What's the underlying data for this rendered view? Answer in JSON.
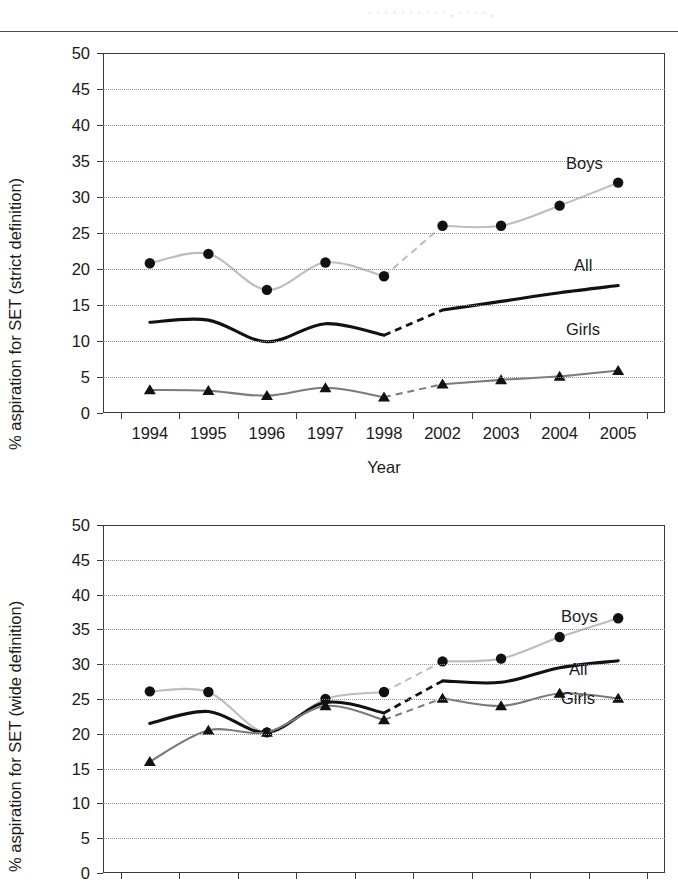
{
  "header": {
    "ghost_text": "· · · · · · · · · ·  ,  · · · ·  ,"
  },
  "charts": [
    {
      "id": "chart1",
      "ylabel": "% aspiration for SET (strict definition)",
      "xlabel": "Year",
      "yticks": [
        "0",
        "5",
        "10",
        "15",
        "20",
        "25",
        "30",
        "35",
        "40",
        "45",
        "50"
      ],
      "xticklabels": [
        "1994",
        "1995",
        "1996",
        "1997",
        "1998",
        "2002",
        "2003",
        "2004",
        "2005"
      ],
      "series_labels": {
        "boys": "Boys",
        "all": "All",
        "girls": "Girls"
      }
    },
    {
      "id": "chart2",
      "ylabel": "% aspiration for SET (wide definition)",
      "xlabel": "",
      "yticks": [
        "0",
        "5",
        "10",
        "15",
        "20",
        "25",
        "30",
        "35",
        "40",
        "45",
        "50"
      ],
      "xticklabels": [
        "1994",
        "1995",
        "1996",
        "1997",
        "1998",
        "2002",
        "2003",
        "2004",
        "2005"
      ],
      "series_labels": {
        "boys": "Boys",
        "all": "All",
        "girls": "Girls"
      }
    }
  ],
  "colors": {
    "boys_line": "#bdbdbd",
    "girls_line": "#7a7a7a",
    "all_line": "#111111",
    "marker": "#111111",
    "grid": "#8f8f8f",
    "axis": "#3a3a3a"
  },
  "chart_data": [
    {
      "type": "line",
      "title": "",
      "xlabel": "Year",
      "ylabel": "% aspiration for SET (strict definition)",
      "categories": [
        "1994",
        "1995",
        "1996",
        "1997",
        "1998",
        "2002",
        "2003",
        "2004",
        "2005"
      ],
      "ylim": [
        0,
        50
      ],
      "ytick_step": 5,
      "grid": true,
      "legend": "inline-labels-right",
      "gap_between": [
        "1998",
        "2002"
      ],
      "series": [
        {
          "name": "Boys",
          "marker": "circle",
          "values": [
            20.8,
            22.1,
            17.1,
            20.9,
            19.0,
            26.0,
            26.0,
            28.8,
            32.0
          ]
        },
        {
          "name": "All",
          "marker": "none",
          "values": [
            12.6,
            12.9,
            9.9,
            12.4,
            10.8,
            14.3,
            15.5,
            16.7,
            17.7
          ]
        },
        {
          "name": "Girls",
          "marker": "triangle",
          "values": [
            3.2,
            3.1,
            2.4,
            3.5,
            2.2,
            4.0,
            4.6,
            5.1,
            5.9
          ]
        }
      ]
    },
    {
      "type": "line",
      "title": "",
      "xlabel": "",
      "ylabel": "% aspiration for SET (wide definition)",
      "categories": [
        "1994",
        "1995",
        "1996",
        "1997",
        "1998",
        "2002",
        "2003",
        "2004",
        "2005"
      ],
      "ylim": [
        0,
        50
      ],
      "ytick_step": 5,
      "grid": true,
      "legend": "inline-labels-right",
      "gap_between": [
        "1998",
        "2002"
      ],
      "series": [
        {
          "name": "Boys",
          "marker": "circle",
          "values": [
            26.1,
            26.0,
            20.2,
            25.0,
            26.0,
            30.4,
            30.8,
            33.9,
            36.6
          ]
        },
        {
          "name": "All",
          "marker": "none",
          "values": [
            21.5,
            23.2,
            20.2,
            24.5,
            23.0,
            27.6,
            27.4,
            29.5,
            30.5
          ]
        },
        {
          "name": "Girls",
          "marker": "triangle",
          "values": [
            16.0,
            20.5,
            20.2,
            24.0,
            22.0,
            25.1,
            24.0,
            25.8,
            25.1
          ]
        }
      ]
    }
  ]
}
